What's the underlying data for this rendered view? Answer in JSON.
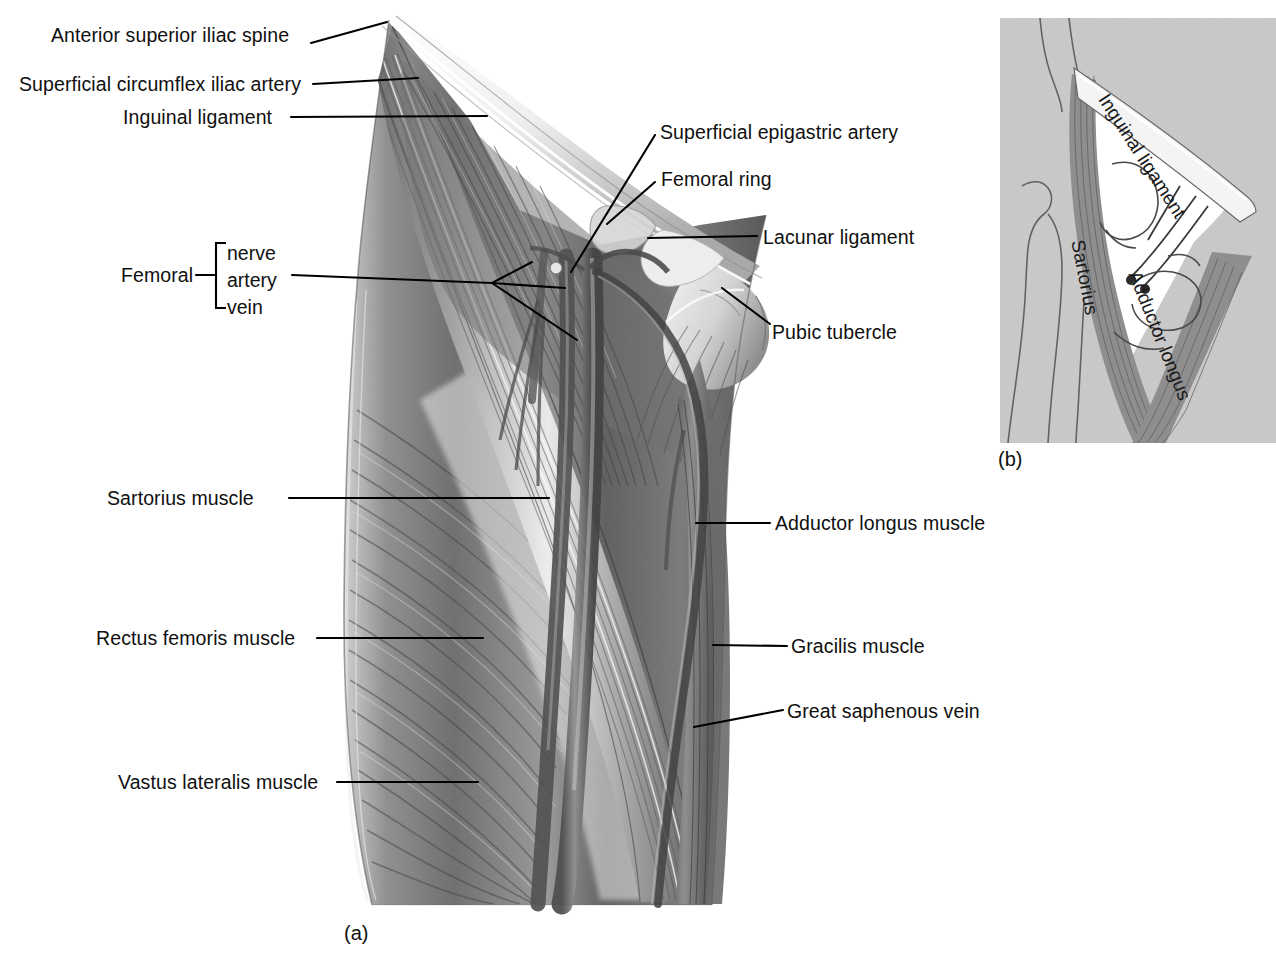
{
  "figure": {
    "panel_a_caption": "(a)",
    "panel_b_caption": "(b)"
  },
  "labels_left": [
    {
      "id": "anterior-superior-iliac-spine",
      "text": "Anterior superior iliac spine"
    },
    {
      "id": "superficial-circumflex-iliac-artery",
      "text": "Superficial circumflex iliac artery"
    },
    {
      "id": "inguinal-ligament",
      "text": "Inguinal ligament"
    },
    {
      "id": "sartorius-muscle",
      "text": "Sartorius muscle"
    },
    {
      "id": "rectus-femoris-muscle",
      "text": "Rectus femoris muscle"
    },
    {
      "id": "vastus-lateralis-muscle",
      "text": "Vastus lateralis muscle"
    }
  ],
  "labels_right": [
    {
      "id": "superficial-epigastric-artery",
      "text": "Superficial epigastric artery"
    },
    {
      "id": "femoral-ring",
      "text": "Femoral ring"
    },
    {
      "id": "lacunar-ligament",
      "text": "Lacunar ligament"
    },
    {
      "id": "pubic-tubercle",
      "text": "Pubic tubercle"
    },
    {
      "id": "adductor-longus-muscle",
      "text": "Adductor longus muscle"
    },
    {
      "id": "gracilis-muscle",
      "text": "Gracilis muscle"
    },
    {
      "id": "great-saphenous-vein",
      "text": "Great saphenous vein"
    }
  ],
  "femoral_bracket": {
    "group_label": "Femoral",
    "items": [
      "nerve",
      "artery",
      "vein"
    ]
  },
  "panel_b_labels": [
    {
      "id": "inguinal-ligament-b",
      "text": "Inguinal ligament"
    },
    {
      "id": "sartorius-b",
      "text": "Sartorius"
    },
    {
      "id": "adductor-longus-b",
      "text": "Adductor longus"
    }
  ],
  "colors": {
    "ink": "#101010",
    "leader": "#000000",
    "panel_b_background": "#c9c9c9",
    "panel_b_triangle": "#ffffff",
    "muscle_mid": "#8a8a8a",
    "muscle_dark": "#4a4a4a",
    "muscle_light": "#d8d8d8",
    "page_background": "#ffffff"
  }
}
